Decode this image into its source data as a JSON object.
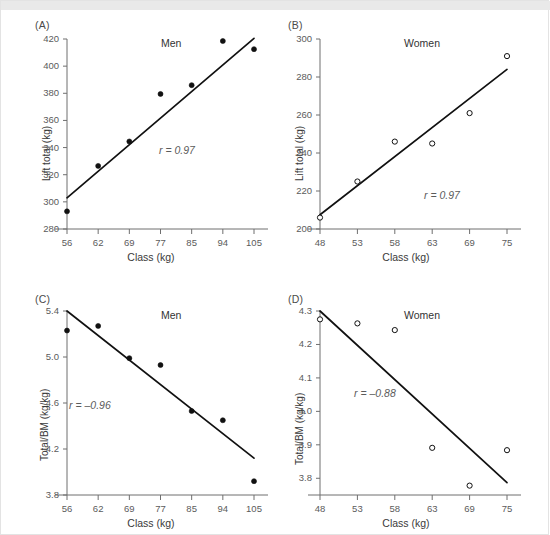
{
  "figure": {
    "panels": [
      "A",
      "B",
      "C",
      "D"
    ]
  },
  "chart_data": [
    {
      "panel": "A",
      "type": "scatter",
      "title": "Men",
      "xlabel": "Class (kg)",
      "ylabel": "Lift total (kg)",
      "categories": [
        "56",
        "62",
        "69",
        "77",
        "85",
        "94",
        "105"
      ],
      "values": [
        293.0,
        326.5,
        344.5,
        379.5,
        386.0,
        418.5,
        412.5
      ],
      "ylim": [
        280,
        420
      ],
      "yticks": [
        "280",
        "300",
        "320",
        "340",
        "360",
        "380",
        "400",
        "420"
      ],
      "marker": "filled-circle",
      "annotation": "r = 0.97",
      "r_value": 0.97,
      "fit_line": {
        "x0": "56",
        "y0": 303.0,
        "x1": "105",
        "y1": 420.5
      },
      "grid": false,
      "legend": "none"
    },
    {
      "panel": "B",
      "type": "scatter",
      "title": "Women",
      "xlabel": "Class (kg)",
      "ylabel": "Lift total (kg)",
      "categories": [
        "48",
        "53",
        "58",
        "63",
        "69",
        "75"
      ],
      "values": [
        206.0,
        225.0,
        246.0,
        245.0,
        261.0,
        291.0
      ],
      "ylim": [
        200,
        300
      ],
      "yticks": [
        "200",
        "220",
        "240",
        "260",
        "280",
        "300"
      ],
      "marker": "open-circle",
      "annotation": "r = 0.97",
      "r_value": 0.97,
      "fit_line": {
        "x0": "48",
        "y0": 207.5,
        "x1": "75",
        "y1": 284.0
      },
      "grid": false,
      "legend": "none"
    },
    {
      "panel": "C",
      "type": "scatter",
      "title": "Men",
      "xlabel": "Class (kg)",
      "ylabel": "Total/BM (kg/kg)",
      "categories": [
        "56",
        "62",
        "69",
        "77",
        "85",
        "94",
        "105"
      ],
      "values": [
        5.23,
        5.27,
        4.99,
        4.93,
        4.53,
        4.45,
        3.92
      ],
      "ylim": [
        3.8,
        5.4
      ],
      "yticks": [
        "3.8",
        "4.2",
        "4.6",
        "5.0",
        "5.4"
      ],
      "marker": "filled-circle",
      "annotation": "r = –0.96",
      "r_value": -0.96,
      "fit_line": {
        "x0": "56",
        "y0": 5.4,
        "x1": "105",
        "y1": 4.12
      },
      "grid": false,
      "legend": "none"
    },
    {
      "panel": "D",
      "type": "scatter",
      "title": "Women",
      "xlabel": "Class (kg)",
      "ylabel": "Total/BM (kg/kg)",
      "categories": [
        "48",
        "53",
        "58",
        "63",
        "69",
        "75"
      ],
      "values": [
        4.275,
        4.263,
        4.243,
        3.891,
        3.778,
        3.884
      ],
      "ylim": [
        3.75,
        4.3
      ],
      "yticks": [
        "3.8",
        "3.9",
        "4.0",
        "4.1",
        "4.2",
        "4.3"
      ],
      "marker": "open-circle",
      "annotation": "r = –0.88",
      "r_value": -0.88,
      "fit_line": {
        "x0": "48",
        "y0": 4.3,
        "x1": "75",
        "y1": 3.787
      },
      "grid": false,
      "legend": "none"
    }
  ],
  "colors": {
    "axis": "#6f6f6f",
    "marker": "#111111",
    "fit_line": "#111111",
    "text": "#3a3a3a",
    "tick_text": "#5b5b5b",
    "background": "#ffffff"
  }
}
